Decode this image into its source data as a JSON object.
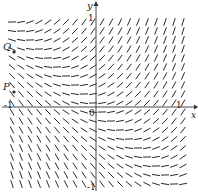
{
  "diagram": {
    "colors": {
      "segment": "#2a2a2a",
      "axis": "#333333",
      "background": "#ffffff"
    },
    "axes": {
      "x_label": "x",
      "y_label": "y",
      "origin_label": "0",
      "x_ticks": [
        {
          "value": -1,
          "label": "-1"
        },
        {
          "value": 1,
          "label": "1"
        }
      ],
      "y_ticks": [
        {
          "value": 1,
          "label": "1"
        },
        {
          "value": -1,
          "label": "-1"
        }
      ],
      "range": {
        "x": [
          -1,
          1
        ],
        "y": [
          -1,
          1
        ]
      }
    },
    "points": [
      {
        "label": "Q",
        "x": -0.95,
        "y": 0.58
      },
      {
        "label": "P",
        "x": -0.95,
        "y": 0.17
      }
    ],
    "slope_field": {
      "equation": "dy/dx = x + y",
      "grid_step_px": 9,
      "segment_length_px": 8
    }
  }
}
